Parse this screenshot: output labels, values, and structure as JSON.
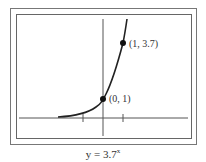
{
  "figure": {
    "caption_base": "y = 3.7",
    "caption_exponent": "x",
    "points": [
      {
        "label": "(0, 1)",
        "x": 0,
        "y": 1
      },
      {
        "label": "(1, 3.7)",
        "x": 1,
        "y": 3.7
      }
    ],
    "function": "y = 3.7^x",
    "x_ticks": [
      -1,
      1
    ],
    "colors": {
      "line": "#222222",
      "frame": "#666666",
      "axis": "#555555"
    }
  }
}
